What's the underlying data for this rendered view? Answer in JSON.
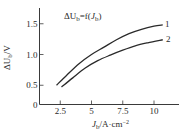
{
  "chart_data": {
    "type": "line",
    "title_parts": {
      "delta": "ΔU",
      "sub1": "b",
      "mid": "=f(",
      "J": "J",
      "sub2": "b",
      "end": ")"
    },
    "xlabel": "J_b/A·cm⁻²",
    "xlabel_parts": {
      "J": "J",
      "sub": "b",
      "unit": "/A·cm",
      "sup": "−2"
    },
    "ylabel": "ΔU_b/V",
    "ylabel_parts": {
      "delta": "ΔU",
      "sub": "b",
      "unit": "/V"
    },
    "x_ticks": [
      "2.5",
      "5",
      "7.5",
      "10"
    ],
    "y_ticks": [
      "0",
      "0.5",
      "1.0",
      "1.5"
    ],
    "xlim": [
      0.8,
      12
    ],
    "ylim": [
      0,
      1.75
    ],
    "grid": false,
    "legend_position": "inline labels at right end of curves",
    "series": [
      {
        "name": "1",
        "x": [
          2.2,
          3.0,
          4.0,
          5.0,
          6.0,
          7.0,
          8.0,
          9.0,
          10.0,
          10.7
        ],
        "y": [
          0.5,
          0.66,
          0.85,
          1.0,
          1.12,
          1.24,
          1.34,
          1.41,
          1.46,
          1.48
        ]
      },
      {
        "name": "2",
        "x": [
          2.6,
          3.5,
          4.5,
          5.5,
          6.5,
          7.5,
          8.5,
          9.5,
          10.7
        ],
        "y": [
          0.47,
          0.62,
          0.78,
          0.9,
          0.99,
          1.07,
          1.14,
          1.19,
          1.24
        ]
      }
    ]
  },
  "colors": {
    "axis": "#3a3a3a",
    "curve": "#2a2a2a",
    "text": "#2a2a2a",
    "background": "#ffffff"
  }
}
